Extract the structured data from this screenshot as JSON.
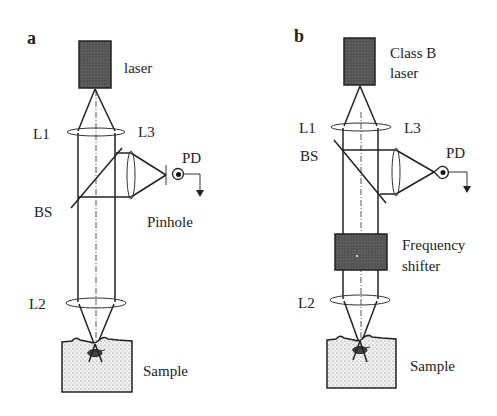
{
  "figure": {
    "panels": [
      {
        "id": "a",
        "label": "a",
        "source_label": "laser",
        "components": {
          "L1": "L1",
          "L2": "L2",
          "L3": "L3",
          "BS": "BS",
          "PD": "PD",
          "pinhole": "Pinhole",
          "sample": "Sample"
        }
      },
      {
        "id": "b",
        "label": "b",
        "source_label_line1": "Class B",
        "source_label_line2": "laser",
        "components": {
          "L1": "L1",
          "L2": "L2",
          "L3": "L3",
          "BS": "BS",
          "PD": "PD",
          "shifter_line1": "Frequency",
          "shifter_line2": "shifter",
          "sample": "Sample"
        }
      }
    ],
    "colors": {
      "line": "#222222",
      "laser_fill": "#555555",
      "shifter_fill": "#5a5a5a",
      "sample_fill": "#ececec",
      "background": "#ffffff"
    }
  }
}
